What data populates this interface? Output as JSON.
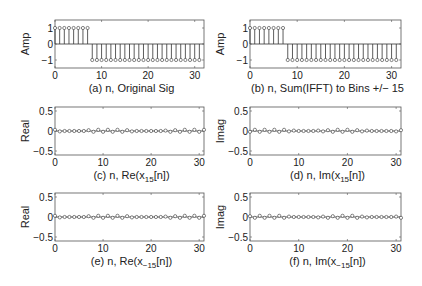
{
  "figure": {
    "width": 422,
    "height": 286,
    "background": "#ffffff",
    "stroke_color": "#333333",
    "frame_color": "#555555"
  },
  "chart_data": [
    {
      "id": "a",
      "type": "stem",
      "title": "",
      "xlabel": "(a)  n, Original Sig",
      "ylabel": "Amp",
      "xlim": [
        0,
        32
      ],
      "ylim": [
        -1.5,
        1.5
      ],
      "xticks": [
        0,
        10,
        20,
        30
      ],
      "yticks": [
        -1,
        0,
        1
      ],
      "ytick_labels": [
        "−1",
        "0",
        "1"
      ],
      "grid": false,
      "legend": null,
      "frame": {
        "x": 55,
        "y": 20,
        "w": 149,
        "h": 48
      },
      "x": [
        0,
        1,
        2,
        3,
        4,
        5,
        6,
        7,
        8,
        9,
        10,
        11,
        12,
        13,
        14,
        15,
        16,
        17,
        18,
        19,
        20,
        21,
        22,
        23,
        24,
        25,
        26,
        27,
        28,
        29,
        30,
        31
      ],
      "values": [
        1,
        1,
        1,
        1,
        1,
        1,
        1,
        1,
        -1,
        -1,
        -1,
        -1,
        -1,
        -1,
        -1,
        -1,
        -1,
        -1,
        -1,
        -1,
        -1,
        -1,
        -1,
        -1,
        -1,
        -1,
        -1,
        -1,
        -1,
        -1,
        -1,
        -1
      ]
    },
    {
      "id": "b",
      "type": "stem",
      "title": "",
      "xlabel": "(b) n, Sum(IFFT) to Bins +/− 15",
      "ylabel": "Amp",
      "xlim": [
        0,
        32
      ],
      "ylim": [
        -1.5,
        1.5
      ],
      "xticks": [
        0,
        10,
        20,
        30
      ],
      "yticks": [
        -1,
        0,
        1
      ],
      "ytick_labels": [
        "−1",
        "0",
        "1"
      ],
      "grid": false,
      "legend": null,
      "frame": {
        "x": 250,
        "y": 20,
        "w": 151,
        "h": 48
      },
      "x": [
        0,
        1,
        2,
        3,
        4,
        5,
        6,
        7,
        8,
        9,
        10,
        11,
        12,
        13,
        14,
        15,
        16,
        17,
        18,
        19,
        20,
        21,
        22,
        23,
        24,
        25,
        26,
        27,
        28,
        29,
        30,
        31
      ],
      "values": [
        1,
        1,
        1,
        1,
        1,
        1,
        1,
        1,
        -1,
        -1,
        -1,
        -1,
        -1,
        -1,
        -1,
        -1,
        -1,
        -1,
        -1,
        -1,
        -1,
        -1,
        -1,
        -1,
        -1,
        -1,
        -1,
        -1,
        -1,
        -1,
        -1,
        -1
      ]
    },
    {
      "id": "c",
      "type": "stem",
      "title": "",
      "xlabel": "(c) n, Re(x",
      "xlabel_sub": "15",
      "xlabel_tail": "[n])",
      "ylabel": "Real",
      "xlim": [
        0,
        31
      ],
      "ylim": [
        -0.6,
        0.6
      ],
      "xticks": [
        0,
        10,
        20,
        30
      ],
      "yticks": [
        -0.5,
        0,
        0.5
      ],
      "ytick_labels": [
        "−0.5",
        "0",
        "0.5"
      ],
      "grid": false,
      "legend": null,
      "frame": {
        "x": 55,
        "y": 107,
        "w": 149,
        "h": 48
      },
      "x": [
        0,
        1,
        2,
        3,
        4,
        5,
        6,
        7,
        8,
        9,
        10,
        11,
        12,
        13,
        14,
        15,
        16,
        17,
        18,
        19,
        20,
        21,
        22,
        23,
        24,
        25,
        26,
        27,
        28,
        29,
        30,
        31
      ],
      "values": [
        0.03,
        -0.01,
        0.0,
        0.0,
        0.0,
        0.0,
        0.0,
        0.02,
        -0.02,
        0.03,
        -0.02,
        0.03,
        -0.02,
        0.03,
        -0.02,
        0.02,
        -0.01,
        0.0,
        0.0,
        0.0,
        0.0,
        0.0,
        0.0,
        0.01,
        -0.02,
        0.02,
        -0.02,
        0.03,
        -0.02,
        0.03,
        -0.02,
        0.03
      ]
    },
    {
      "id": "d",
      "type": "stem",
      "title": "",
      "xlabel": "(d) n, Im(x",
      "xlabel_sub": "15",
      "xlabel_tail": "[n])",
      "ylabel": "Imag",
      "xlim": [
        0,
        31
      ],
      "ylim": [
        -0.6,
        0.6
      ],
      "xticks": [
        0,
        10,
        20,
        30
      ],
      "yticks": [
        -0.5,
        0,
        0.5
      ],
      "ytick_labels": [
        "−0.5",
        "0",
        "0.5"
      ],
      "grid": false,
      "legend": null,
      "frame": {
        "x": 250,
        "y": 107,
        "w": 151,
        "h": 48
      },
      "x": [
        0,
        1,
        2,
        3,
        4,
        5,
        6,
        7,
        8,
        9,
        10,
        11,
        12,
        13,
        14,
        15,
        16,
        17,
        18,
        19,
        20,
        21,
        22,
        23,
        24,
        25,
        26,
        27,
        28,
        29,
        30,
        31
      ],
      "values": [
        -0.02,
        0.03,
        -0.02,
        0.03,
        -0.02,
        0.03,
        -0.02,
        0.03,
        -0.01,
        0.01,
        0.0,
        0.0,
        0.0,
        0.0,
        0.01,
        -0.01,
        0.02,
        -0.02,
        0.03,
        -0.02,
        0.03,
        -0.02,
        0.02,
        -0.01,
        0.01,
        0.0,
        0.0,
        0.0,
        0.0,
        0.0,
        -0.01,
        0.02
      ]
    },
    {
      "id": "e",
      "type": "stem",
      "title": "",
      "xlabel": "(e) n, Re(x",
      "xlabel_sub": "−15",
      "xlabel_tail": "[n])",
      "ylabel": "Real",
      "xlim": [
        0,
        31
      ],
      "ylim": [
        -0.6,
        0.6
      ],
      "xticks": [
        0,
        10,
        20,
        30
      ],
      "yticks": [
        -0.5,
        0,
        0.5
      ],
      "ytick_labels": [
        "−0.5",
        "0",
        "0.5"
      ],
      "grid": false,
      "legend": null,
      "frame": {
        "x": 55,
        "y": 193,
        "w": 149,
        "h": 48
      },
      "x": [
        0,
        1,
        2,
        3,
        4,
        5,
        6,
        7,
        8,
        9,
        10,
        11,
        12,
        13,
        14,
        15,
        16,
        17,
        18,
        19,
        20,
        21,
        22,
        23,
        24,
        25,
        26,
        27,
        28,
        29,
        30,
        31
      ],
      "values": [
        0.03,
        -0.01,
        0.0,
        0.0,
        0.0,
        0.0,
        0.0,
        0.02,
        -0.02,
        0.03,
        -0.02,
        0.03,
        -0.02,
        0.03,
        -0.02,
        0.02,
        -0.01,
        0.0,
        0.0,
        0.0,
        0.0,
        0.0,
        0.0,
        0.01,
        -0.02,
        0.02,
        -0.02,
        0.03,
        -0.02,
        0.03,
        -0.02,
        0.03
      ]
    },
    {
      "id": "f",
      "type": "stem",
      "title": "",
      "xlabel": "(f) n, Im(x",
      "xlabel_sub": "−15",
      "xlabel_tail": "[n])",
      "ylabel": "Imag",
      "xlim": [
        0,
        31
      ],
      "ylim": [
        -0.6,
        0.6
      ],
      "xticks": [
        0,
        10,
        20,
        30
      ],
      "yticks": [
        -0.5,
        0,
        0.5
      ],
      "ytick_labels": [
        "−0.5",
        "0",
        "0.5"
      ],
      "grid": false,
      "legend": null,
      "frame": {
        "x": 250,
        "y": 193,
        "w": 151,
        "h": 48
      },
      "x": [
        0,
        1,
        2,
        3,
        4,
        5,
        6,
        7,
        8,
        9,
        10,
        11,
        12,
        13,
        14,
        15,
        16,
        17,
        18,
        19,
        20,
        21,
        22,
        23,
        24,
        25,
        26,
        27,
        28,
        29,
        30,
        31
      ],
      "values": [
        0.02,
        -0.02,
        0.03,
        -0.02,
        0.03,
        -0.02,
        0.03,
        -0.02,
        0.01,
        0.0,
        0.0,
        0.0,
        0.0,
        0.0,
        -0.01,
        0.01,
        -0.02,
        0.02,
        -0.02,
        0.03,
        -0.02,
        0.03,
        -0.02,
        0.01,
        -0.01,
        0.0,
        0.0,
        0.0,
        0.0,
        0.0,
        0.01,
        -0.02
      ]
    }
  ]
}
